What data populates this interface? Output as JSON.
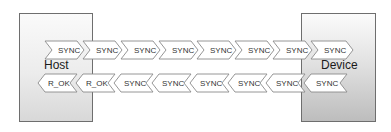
{
  "diagram": {
    "host": {
      "label": "Host"
    },
    "device": {
      "label": "Device"
    },
    "top_row": {
      "direction": "host-to-device",
      "packets": [
        "SYNC",
        "SYNC",
        "SYNC",
        "SYNC",
        "SYNC",
        "SYNC",
        "SYNC",
        "SYNC"
      ]
    },
    "bottom_row": {
      "direction": "device-to-host",
      "packets": [
        "R_OK",
        "R_OK",
        "SYNC",
        "SYNC",
        "SYNC",
        "SYNC",
        "SYNC",
        "SYNC"
      ]
    },
    "colors": {
      "border": "#6e6e6e",
      "chevron_stroke": "#8a8a8a",
      "chevron_fill": "#ffffff",
      "text": "#333333"
    }
  }
}
